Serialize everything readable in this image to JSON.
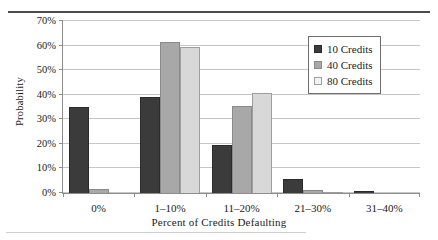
{
  "figure": {
    "top_rule_ghost_text": "",
    "y_axis_title": "Probability",
    "x_axis_title": "Percent of Credits Defaulting"
  },
  "legend": {
    "entries": [
      {
        "label": "10 Credits",
        "color": "#3b3b3b",
        "swatch": "legend-swatch-10-credits"
      },
      {
        "label": "40 Credits",
        "color": "#a8a8a8",
        "swatch": "legend-swatch-40-credits"
      },
      {
        "label": "80 Credits",
        "color": "#f2f2f2",
        "swatch": "legend-swatch-80-credits"
      }
    ]
  },
  "chart_data": {
    "type": "bar",
    "title": "",
    "xlabel": "Percent of Credits Defaulting",
    "ylabel": "Probability",
    "categories": [
      "0%",
      "1–10%",
      "11–20%",
      "21–30%",
      "31–40%"
    ],
    "series": [
      {
        "name": "10 Credits",
        "color": "#3b3b3b",
        "values": [
          34.8,
          38.8,
          19.5,
          5.5,
          1.0
        ]
      },
      {
        "name": "40 Credits",
        "color": "#a8a8a8",
        "values": [
          1.8,
          61.0,
          35.3,
          1.4,
          0.0
        ]
      },
      {
        "name": "80 Credits",
        "color": "#d8d8d8",
        "values": [
          0.0,
          59.0,
          40.3,
          0.3,
          0.0
        ]
      }
    ],
    "ylim": [
      0,
      70
    ],
    "yticks": [
      0,
      10,
      20,
      30,
      40,
      50,
      60,
      70
    ],
    "ytick_labels": [
      "0%",
      "10%",
      "20%",
      "30%",
      "40%",
      "50%",
      "60%",
      "70%"
    ],
    "grid": "horizontal",
    "legend_position": "upper-right"
  }
}
